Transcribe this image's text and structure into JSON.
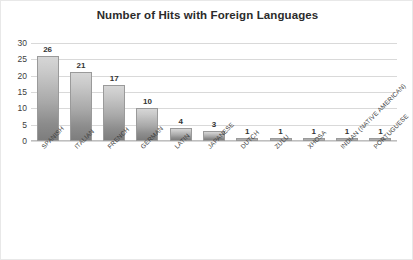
{
  "chart_data": {
    "type": "bar",
    "title": "Number of Hits with Foreign Languages",
    "xlabel": "",
    "ylabel": "",
    "ylim": [
      0,
      30
    ],
    "yticks": [
      0,
      5,
      10,
      15,
      20,
      25,
      30
    ],
    "grid": true,
    "legend": false,
    "data_labels": true,
    "categories": [
      "SPANISH",
      "ITALIAN",
      "FRENCH",
      "GERMAN",
      "LATIN",
      "JAPANESE",
      "DUTCH",
      "ZULU",
      "XHOSA",
      "INDIAN (NATIVE AMERICAN)",
      "PORTUGUESE"
    ],
    "values": [
      26,
      21,
      17,
      10,
      4,
      3,
      1,
      1,
      1,
      1,
      1
    ],
    "labels": [
      "26",
      "21",
      "17",
      "10",
      "4",
      "3",
      "1",
      "1",
      "1",
      "1",
      "1"
    ],
    "ytick_labels": [
      "0",
      "5",
      "10",
      "15",
      "20",
      "25",
      "30"
    ],
    "colors": {
      "bar_top": "#d6d6d6",
      "bar_bottom": "#7d7d7d",
      "bar_border": "#9a9a9a",
      "gridline": "#d9d9d9",
      "axis": "#bfbfbf",
      "text": "#333333",
      "plot_background": "#ffffff"
    }
  }
}
